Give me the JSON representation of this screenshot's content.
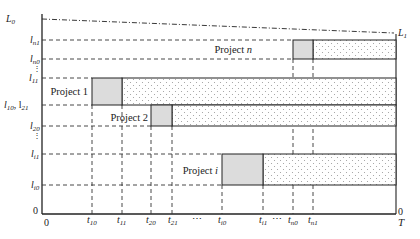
{
  "diagram": {
    "type": "project-timeline-gantt",
    "y_axis_labels": {
      "L0": "L0",
      "ln1": "l_n1",
      "ln0": "l_n0",
      "vdots": "⋮",
      "l11": "l_11",
      "l10_l21": "l_10, l_21",
      "l20": "l_20",
      "li1": "l_i1",
      "li0": "l_i0",
      "zero": "0"
    },
    "x_axis_labels": {
      "origin": "0",
      "t10": "t_10",
      "t11": "t_11",
      "t20": "t_20",
      "t21": "t_21",
      "dots1": "⋯",
      "ti0": "t_i0",
      "ti1": "t_i1",
      "dots2": "⋯",
      "tn0": "t_n0",
      "tn1": "t_n1",
      "end_zero": "0",
      "T": "T"
    },
    "right_label": "L1",
    "projects": [
      {
        "name": "Project 1",
        "label_main": "Project 1",
        "label_italic": ""
      },
      {
        "name": "Project 2",
        "label_main": "Project 2",
        "label_italic": ""
      },
      {
        "name": "Project i",
        "label_main": "Project ",
        "label_italic": "i"
      },
      {
        "name": "Project n",
        "label_main": "Project ",
        "label_italic": "n"
      }
    ],
    "colors": {
      "axis": "#222222",
      "solid_fill": "#dcdcdc",
      "dotted_fill_dot": "#9a9a9a",
      "dashed": "#333333"
    }
  }
}
